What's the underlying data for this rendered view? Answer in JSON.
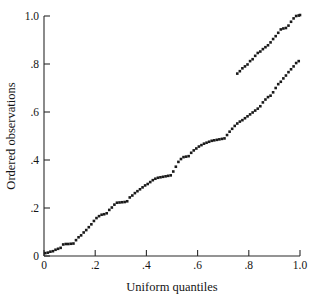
{
  "chart_data": {
    "type": "scatter",
    "title": "",
    "xlabel": "Uniform quantiles",
    "ylabel": "Ordered observations",
    "xlim": [
      0,
      1.0
    ],
    "ylim": [
      0,
      1.0
    ],
    "grid": false,
    "legend": null,
    "xticks": [
      0,
      0.2,
      0.4,
      0.6,
      0.8,
      1.0
    ],
    "xtick_labels": [
      "0",
      ".2",
      ".4",
      ".6",
      ".8",
      "1.0"
    ],
    "yticks": [
      0,
      0.2,
      0.4,
      0.6,
      0.8,
      1.0
    ],
    "ytick_labels": [
      "0",
      ".2",
      ".4",
      ".6",
      ".8",
      "1.0"
    ],
    "marker": "square",
    "marker_color": "#1a1a1a",
    "marker_size_px": 2.6,
    "n_points": 100,
    "x": [
      0.005,
      0.015,
      0.025,
      0.035,
      0.045,
      0.055,
      0.065,
      0.075,
      0.085,
      0.095,
      0.105,
      0.115,
      0.125,
      0.135,
      0.145,
      0.155,
      0.165,
      0.175,
      0.185,
      0.195,
      0.205,
      0.215,
      0.225,
      0.235,
      0.245,
      0.255,
      0.265,
      0.275,
      0.285,
      0.295,
      0.305,
      0.315,
      0.325,
      0.335,
      0.345,
      0.355,
      0.365,
      0.375,
      0.385,
      0.395,
      0.405,
      0.415,
      0.425,
      0.435,
      0.445,
      0.455,
      0.465,
      0.475,
      0.485,
      0.495,
      0.505,
      0.515,
      0.525,
      0.535,
      0.545,
      0.555,
      0.565,
      0.575,
      0.585,
      0.595,
      0.605,
      0.615,
      0.625,
      0.635,
      0.645,
      0.655,
      0.665,
      0.675,
      0.685,
      0.695,
      0.705,
      0.715,
      0.725,
      0.735,
      0.745,
      0.755,
      0.765,
      0.775,
      0.785,
      0.795,
      0.805,
      0.815,
      0.825,
      0.835,
      0.845,
      0.855,
      0.865,
      0.875,
      0.885,
      0.895,
      0.905,
      0.915,
      0.925,
      0.935,
      0.945,
      0.955,
      0.965,
      0.975,
      0.985,
      0.995
    ],
    "y": [
      0.012,
      0.014,
      0.018,
      0.02,
      0.026,
      0.03,
      0.034,
      0.048,
      0.05,
      0.05,
      0.051,
      0.052,
      0.066,
      0.078,
      0.086,
      0.098,
      0.108,
      0.12,
      0.132,
      0.146,
      0.158,
      0.166,
      0.172,
      0.174,
      0.178,
      0.192,
      0.202,
      0.214,
      0.222,
      0.223,
      0.224,
      0.225,
      0.228,
      0.244,
      0.252,
      0.262,
      0.27,
      0.278,
      0.286,
      0.294,
      0.3,
      0.308,
      0.316,
      0.322,
      0.326,
      0.328,
      0.33,
      0.332,
      0.334,
      0.336,
      0.352,
      0.372,
      0.392,
      0.404,
      0.412,
      0.414,
      0.416,
      0.43,
      0.44,
      0.448,
      0.456,
      0.462,
      0.468,
      0.472,
      0.476,
      0.48,
      0.482,
      0.484,
      0.486,
      0.488,
      0.49,
      0.504,
      0.518,
      0.53,
      0.542,
      0.552,
      0.56,
      0.566,
      0.574,
      0.582,
      0.59,
      0.598,
      0.606,
      0.614,
      0.624,
      0.64,
      0.652,
      0.662,
      0.668,
      0.682,
      0.7,
      0.716,
      0.726,
      0.74,
      0.752,
      0.766,
      0.778,
      0.79,
      0.804,
      0.812
    ],
    "x_tail": [
      0.755,
      0.765,
      0.775,
      0.785,
      0.795,
      0.805,
      0.815,
      0.825,
      0.835,
      0.845,
      0.855,
      0.865,
      0.875,
      0.885,
      0.895,
      0.905,
      0.915,
      0.925,
      0.935,
      0.945,
      0.955,
      0.965,
      0.975,
      0.985,
      0.995,
      1.0
    ],
    "y_tail": [
      0.76,
      0.77,
      0.782,
      0.79,
      0.798,
      0.812,
      0.82,
      0.834,
      0.846,
      0.852,
      0.862,
      0.87,
      0.878,
      0.89,
      0.904,
      0.916,
      0.93,
      0.944,
      0.948,
      0.95,
      0.96,
      0.976,
      0.99,
      1.0,
      1.002,
      1.004
    ]
  },
  "axes": {
    "x_title": "Uniform quantiles",
    "y_title": "Ordered observations"
  }
}
